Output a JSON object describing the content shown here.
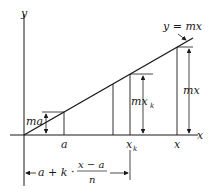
{
  "diagram": {
    "axes": {
      "x_label": "x",
      "y_label": "y"
    },
    "line_label": "y = mx",
    "points": {
      "a": "a",
      "x_k": "x",
      "x_k_sub": "k",
      "x": "x"
    },
    "heights": {
      "ma": "ma",
      "mx_k": "mx",
      "mx_k_sub": "k",
      "mx": "mx"
    },
    "brace": {
      "expr_left": "a + k ·",
      "numerator": "x − a",
      "denominator": "n"
    },
    "colors": {
      "stroke": "#1a1a1a",
      "background": "#ffffff"
    }
  }
}
